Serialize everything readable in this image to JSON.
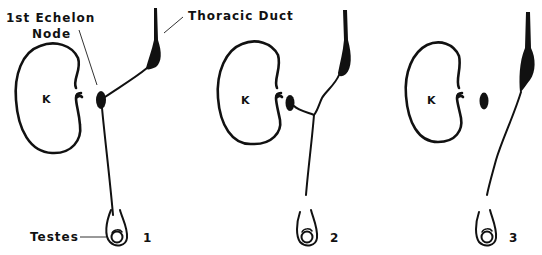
{
  "figure": {
    "labels": {
      "first_echelon_line1": "1st Echelon",
      "first_echelon_line2": "Node",
      "thoracic_duct": "Thoracic Duct",
      "testes": "Testes"
    },
    "panels": [
      {
        "number": "1",
        "kidney_label": "K"
      },
      {
        "number": "2",
        "kidney_label": "K"
      },
      {
        "number": "3",
        "kidney_label": "K"
      }
    ],
    "colors": {
      "ink": "#111111",
      "background": "#ffffff"
    }
  }
}
